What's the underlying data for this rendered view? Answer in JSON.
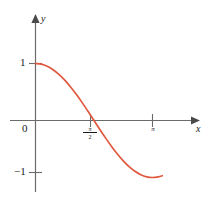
{
  "figure": {
    "background_color": "#ffffff",
    "curve_color": "#e0593f",
    "axis_color": "#6b6b6b",
    "text_color": "#1a1a1a"
  },
  "axes": {
    "x_name": "x",
    "y_name": "y",
    "origin_label": "0"
  },
  "y_ticks": [
    {
      "label": "1",
      "value": 1
    },
    {
      "label": "−1",
      "value": -1
    }
  ],
  "x_ticks": [
    {
      "label_numerator": "π",
      "label_denominator": "2",
      "value": 1.5708
    },
    {
      "label": "π",
      "value": 3.1416
    }
  ],
  "chart_data": {
    "type": "line",
    "title": "",
    "xlabel": "x",
    "ylabel": "y",
    "xlim": [
      0,
      3.6
    ],
    "ylim": [
      -1.35,
      1.35
    ],
    "grid": false,
    "legend": null,
    "x_tick_labels": [
      "π/2",
      "π"
    ],
    "x_tick_values": [
      1.5708,
      3.1416
    ],
    "y_tick_labels": [
      "1",
      "0",
      "−1"
    ],
    "y_tick_values": [
      1,
      0,
      -1
    ],
    "series": [
      {
        "name": "y = cos x",
        "color": "#e0593f",
        "x": [
          0.0,
          0.1571,
          0.3142,
          0.4712,
          0.6283,
          0.7854,
          0.9425,
          1.0996,
          1.2566,
          1.4137,
          1.5708,
          1.7279,
          1.885,
          2.042,
          2.1991,
          2.3562,
          2.5133,
          2.6704,
          2.8274,
          2.9845,
          3.1416,
          3.2987,
          3.4034
        ],
        "y": [
          1.0,
          0.9877,
          0.9511,
          0.891,
          0.809,
          0.7071,
          0.5878,
          0.454,
          0.309,
          0.1564,
          0.0,
          -0.1564,
          -0.309,
          -0.454,
          -0.5878,
          -0.7071,
          -0.809,
          -0.891,
          -0.9511,
          -0.9877,
          -1.0,
          -0.9877,
          -0.9686
        ]
      }
    ]
  }
}
